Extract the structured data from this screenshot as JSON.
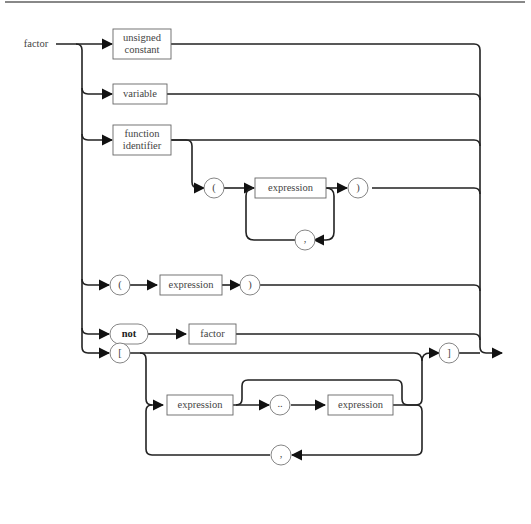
{
  "diagram": {
    "title": "factor",
    "type": "syntax-diagram",
    "terminals": [
      "(",
      ")",
      ",",
      "not",
      "[",
      "]",
      ".."
    ],
    "nonterminals": [
      "unsigned constant",
      "variable",
      "function identifier",
      "expression",
      "factor"
    ],
    "branches": [
      {
        "id": "unsigned-constant",
        "elements": [
          "unsigned constant"
        ]
      },
      {
        "id": "variable",
        "elements": [
          "variable"
        ]
      },
      {
        "id": "function-call",
        "elements": [
          "function identifier",
          "(",
          "expression",
          ",",
          ")"
        ]
      },
      {
        "id": "parenthesized",
        "elements": [
          "(",
          "expression",
          ")"
        ]
      },
      {
        "id": "negation",
        "elements": [
          "not",
          "factor"
        ]
      },
      {
        "id": "set",
        "elements": [
          "[",
          "expression",
          "..",
          "expression",
          ",",
          "]"
        ]
      }
    ]
  },
  "labels": {
    "factor_title": "factor",
    "unsigned_constant": "unsigned\nconstant",
    "variable": "variable",
    "function_identifier": "function\nidentifier",
    "expr1": "expression",
    "expr2": "expression",
    "expr3": "expression",
    "expr4": "expression",
    "factor_box": "factor",
    "lparen1": "(",
    "rparen1": ")",
    "comma1": ",",
    "lparen2": "(",
    "rparen2": ")",
    "not": "not",
    "lbracket": "[",
    "rbracket": "]",
    "range": "..",
    "comma2": ","
  }
}
